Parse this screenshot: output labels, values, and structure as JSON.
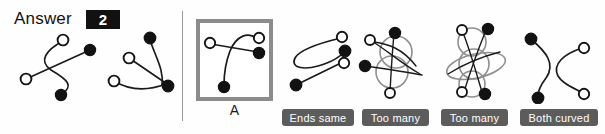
{
  "header": {
    "answer_label": "Answer",
    "answer_value": "2"
  },
  "selected": {
    "letter": "A",
    "border_color": "#8c8c8c"
  },
  "colors": {
    "chip_background": "#5c5c5c",
    "chip_text": "#ffffff",
    "badge_background": "#111111",
    "badge_text": "#ffffff",
    "stroke": "#1b1b1b",
    "tangle_circle": "#8f8f8f",
    "divider": "#9a9a9a",
    "page_background": "#fefefe"
  },
  "prompt_panel": {
    "name": "prompt-figures",
    "figures": [
      {
        "id": "prompt-figure-1",
        "description": "s-curve-with-crossing-straight-line"
      },
      {
        "id": "prompt-figure-2",
        "description": "two-strands-meeting-at-filled-node"
      }
    ]
  },
  "options": [
    {
      "id": "option-a",
      "letter": "A",
      "selected": true,
      "feedback": "",
      "description": "open-node-line-to-filled-node-plus-arc-to-filled-node"
    },
    {
      "id": "option-b",
      "letter": "",
      "selected": false,
      "feedback": "Ends same",
      "description": "looping-curve-with-straight-line"
    },
    {
      "id": "option-c",
      "letter": "",
      "selected": false,
      "feedback": "Too many",
      "description": "two-overlapping-circles-tangle"
    },
    {
      "id": "option-d",
      "letter": "",
      "selected": false,
      "feedback": "Too many",
      "description": "three-overlapping-circles-tangle"
    },
    {
      "id": "option-e",
      "letter": "",
      "selected": false,
      "feedback": "Both curved",
      "description": "two-curved-strands-no-straight-line"
    }
  ]
}
